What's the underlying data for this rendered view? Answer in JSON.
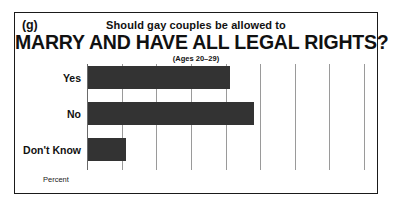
{
  "figure": {
    "panel_letter": "(g)",
    "title_line_1": "Should gay couples be allowed to",
    "title_line_2": "MARRY AND HAVE ALL LEGAL RIGHTS?",
    "subtitle": "(Ages 20–29)",
    "axis_name": "Percent",
    "border_color": "#1a1a1a",
    "bar_color": "#333333",
    "gridline_color": "#9a9a9a"
  },
  "chart_data": {
    "type": "bar",
    "orientation": "horizontal",
    "title": "Should gay couples be allowed to MARRY AND HAVE ALL LEGAL RIGHTS?",
    "subtitle": "(Ages 20–29)",
    "categories": [
      "Yes",
      "No",
      "Don't Know"
    ],
    "values": [
      41,
      48,
      11
    ],
    "xlabel": "Percent",
    "ylabel": "",
    "xlim": [
      0,
      80
    ],
    "xticks": [
      0,
      10,
      20,
      30,
      40,
      50,
      60,
      70,
      80
    ],
    "xtick_labels": [
      "0",
      "10",
      "20",
      "30",
      "40",
      "50",
      "60",
      "70",
      "80"
    ],
    "grid": true,
    "legend": false
  }
}
